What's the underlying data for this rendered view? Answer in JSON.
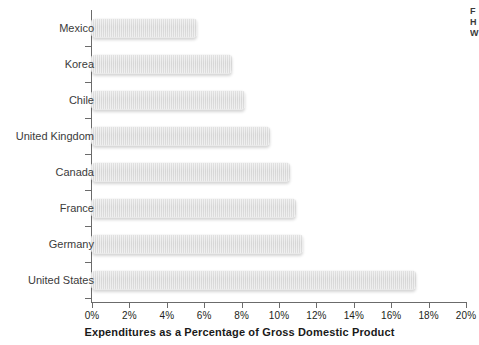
{
  "chart_data": {
    "type": "bar",
    "orientation": "horizontal",
    "title": "",
    "xlabel": "Expenditures as a Percentage of Gross Domestic Product",
    "ylabel": "",
    "categories": [
      "Mexico",
      "Korea",
      "Chile",
      "United Kingdom",
      "Canada",
      "France",
      "Germany",
      "United States"
    ],
    "values": [
      5.6,
      7.5,
      8.2,
      9.5,
      10.6,
      10.9,
      11.3,
      17.3
    ],
    "xlim": [
      0,
      20
    ],
    "xticks": [
      0,
      2,
      4,
      6,
      8,
      10,
      12,
      14,
      16,
      18,
      20
    ],
    "xtick_labels": [
      "0%",
      "2%",
      "4%",
      "6%",
      "8%",
      "10%",
      "12%",
      "14%",
      "16%",
      "18%",
      "20%"
    ],
    "grid": false,
    "legend": null,
    "bar_color": "#d8d8d8",
    "axis_color": "#6b6b6b",
    "label_color": "#3b3b3b",
    "background": "#ffffff"
  },
  "edge_caption": {
    "line1": "F",
    "line2": "H",
    "line3": "W"
  }
}
